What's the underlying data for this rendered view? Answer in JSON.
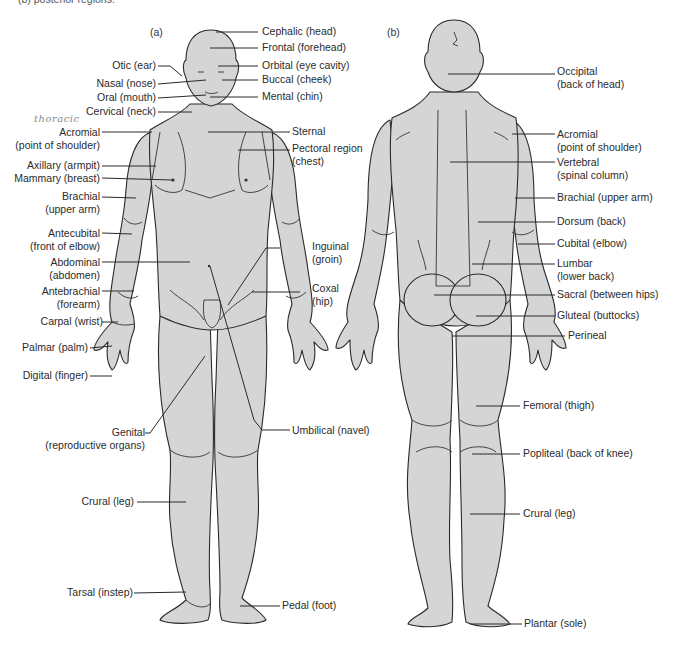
{
  "caption": "(b) posterior regions.",
  "handwritten_note": "thoracic",
  "panels": {
    "anterior": {
      "tag": "(a)",
      "left_labels": [
        {
          "id": "otic",
          "lines": [
            "Otic (ear)"
          ]
        },
        {
          "id": "nasal",
          "lines": [
            "Nasal (nose)"
          ]
        },
        {
          "id": "oral",
          "lines": [
            "Oral (mouth)"
          ]
        },
        {
          "id": "cervical",
          "lines": [
            "Cervical (neck)"
          ]
        },
        {
          "id": "acromial",
          "lines": [
            "Acromial",
            "(point of shoulder)"
          ]
        },
        {
          "id": "axillary",
          "lines": [
            "Axillary (armpit)"
          ]
        },
        {
          "id": "mammary",
          "lines": [
            "Mammary (breast)"
          ]
        },
        {
          "id": "brachial",
          "lines": [
            "Brachial",
            "(upper arm)"
          ]
        },
        {
          "id": "antecubital",
          "lines": [
            "Antecubital",
            "(front of elbow)"
          ]
        },
        {
          "id": "abdominal",
          "lines": [
            "Abdominal",
            "(abdomen)"
          ]
        },
        {
          "id": "antebrachial",
          "lines": [
            "Antebrachial",
            "(forearm)"
          ]
        },
        {
          "id": "carpal",
          "lines": [
            "Carpal (wrist)"
          ]
        },
        {
          "id": "palmar",
          "lines": [
            "Palmar (palm)"
          ]
        },
        {
          "id": "digital",
          "lines": [
            "Digital (finger)"
          ]
        },
        {
          "id": "genital",
          "lines": [
            "Genital",
            "(reproductive organs)"
          ]
        },
        {
          "id": "crural",
          "lines": [
            "Crural (leg)"
          ]
        },
        {
          "id": "tarsal",
          "lines": [
            "Tarsal (instep)"
          ]
        }
      ],
      "right_labels": [
        {
          "id": "cephalic",
          "lines": [
            "Cephalic (head)"
          ]
        },
        {
          "id": "frontal",
          "lines": [
            "Frontal (forehead)"
          ]
        },
        {
          "id": "orbital",
          "lines": [
            "Orbital (eye cavity)"
          ]
        },
        {
          "id": "buccal",
          "lines": [
            "Buccal (cheek)"
          ]
        },
        {
          "id": "mental",
          "lines": [
            "Mental (chin)"
          ]
        },
        {
          "id": "sternal",
          "lines": [
            "Sternal"
          ]
        },
        {
          "id": "pectoral",
          "lines": [
            "Pectoral region",
            "(chest)"
          ]
        },
        {
          "id": "inguinal",
          "lines": [
            "Inguinal",
            "(groin)"
          ]
        },
        {
          "id": "coxal",
          "lines": [
            "Coxal",
            "(hip)"
          ]
        },
        {
          "id": "umbilical",
          "lines": [
            "Umbilical (navel)"
          ]
        },
        {
          "id": "pedal",
          "lines": [
            "Pedal (foot)"
          ]
        }
      ]
    },
    "posterior": {
      "tag": "(b)",
      "right_labels": [
        {
          "id": "occipital",
          "lines": [
            "Occipital",
            "(back of head)"
          ]
        },
        {
          "id": "acromial",
          "lines": [
            "Acromial",
            "(point of shoulder)"
          ]
        },
        {
          "id": "vertebral",
          "lines": [
            "Vertebral",
            "(spinal column)"
          ]
        },
        {
          "id": "brachial",
          "lines": [
            "Brachial (upper arm)"
          ]
        },
        {
          "id": "dorsum",
          "lines": [
            "Dorsum (back)"
          ]
        },
        {
          "id": "cubital",
          "lines": [
            "Cubital (elbow)"
          ]
        },
        {
          "id": "lumbar",
          "lines": [
            "Lumbar",
            "(lower back)"
          ]
        },
        {
          "id": "sacral",
          "lines": [
            "Sacral (between hips)"
          ]
        },
        {
          "id": "gluteal",
          "lines": [
            "Gluteal (buttocks)"
          ]
        },
        {
          "id": "perineal",
          "lines": [
            "Perineal"
          ]
        },
        {
          "id": "femoral",
          "lines": [
            "Femoral (thigh)"
          ]
        },
        {
          "id": "popliteal",
          "lines": [
            "Popliteal (back of knee)"
          ]
        },
        {
          "id": "crural",
          "lines": [
            "Crural (leg)"
          ]
        },
        {
          "id": "plantar",
          "lines": [
            "Plantar (sole)"
          ]
        }
      ]
    }
  }
}
